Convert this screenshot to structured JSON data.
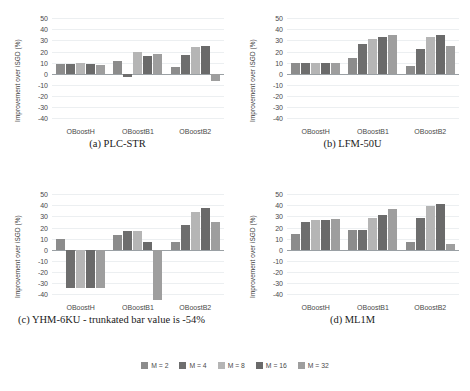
{
  "figure": {
    "ylabel": "Improvement over iSGD (%)",
    "yticks": [
      50,
      40,
      30,
      20,
      10,
      0,
      -10,
      -20,
      -30,
      -40
    ],
    "ylim": [
      -45,
      52
    ],
    "categories": [
      "OBoostH",
      "OBoostB1",
      "OBoostB2"
    ],
    "series_names": [
      "M = 2",
      "M = 4",
      "M = 8",
      "M = 16",
      "M = 32"
    ],
    "colors": [
      "#8c8c8c",
      "#6e6e6e",
      "#b5b5b5",
      "#6a6a6a",
      "#9e9e9e"
    ],
    "captions": {
      "a": "(a) PLC-STR",
      "b": "(b) LFM-50U",
      "c": "(c) YHM-6KU - trunkated bar value is -54%",
      "d": "(d) ML1M"
    }
  },
  "legend": {
    "items": [
      {
        "label": "M = 2",
        "color": "#8c8c8c"
      },
      {
        "label": "M = 4",
        "color": "#6e6e6e"
      },
      {
        "label": "M = 8",
        "color": "#b5b5b5"
      },
      {
        "label": "M = 16",
        "color": "#6a6a6a"
      },
      {
        "label": "M = 32",
        "color": "#9e9e9e"
      }
    ]
  },
  "chart_data": [
    {
      "id": "a",
      "type": "bar",
      "title": "(a) PLC-STR",
      "xlabel": "",
      "ylabel": "Improvement over iSGD (%)",
      "ylim": [
        -45,
        52
      ],
      "grid": true,
      "legend_position": "bottom",
      "categories": [
        "OBoostH",
        "OBoostB1",
        "OBoostB2"
      ],
      "series": [
        {
          "name": "M = 2",
          "values": [
            9,
            12,
            6
          ]
        },
        {
          "name": "M = 4",
          "values": [
            9,
            -3,
            17
          ]
        },
        {
          "name": "M = 8",
          "values": [
            10,
            20,
            24
          ]
        },
        {
          "name": "M = 16",
          "values": [
            9,
            16,
            25
          ]
        },
        {
          "name": "M = 32",
          "values": [
            8,
            18,
            -6
          ]
        }
      ]
    },
    {
      "id": "b",
      "type": "bar",
      "title": "(b) LFM-50U",
      "xlabel": "",
      "ylabel": "Improvement over iSGD (%)",
      "ylim": [
        -45,
        52
      ],
      "grid": true,
      "legend_position": "bottom",
      "categories": [
        "OBoostH",
        "OBoostB1",
        "OBoostB2"
      ],
      "series": [
        {
          "name": "M = 2",
          "values": [
            10,
            14,
            7
          ]
        },
        {
          "name": "M = 4",
          "values": [
            10,
            27,
            22
          ]
        },
        {
          "name": "M = 8",
          "values": [
            10,
            31,
            33
          ]
        },
        {
          "name": "M = 16",
          "values": [
            10,
            33,
            35
          ]
        },
        {
          "name": "M = 32",
          "values": [
            10,
            35,
            25
          ]
        }
      ]
    },
    {
      "id": "c",
      "type": "bar",
      "title": "(c) YHM-6KU - trunkated bar value is -54%",
      "xlabel": "",
      "ylabel": "Improvement over iSGD (%)",
      "ylim": [
        -45,
        52
      ],
      "grid": true,
      "legend_position": "bottom",
      "annotation": "trunkated bar value is -54%",
      "categories": [
        "OBoostH",
        "OBoostB1",
        "OBoostB2"
      ],
      "series": [
        {
          "name": "M = 2",
          "values": [
            10,
            13,
            7
          ]
        },
        {
          "name": "M = 4",
          "values": [
            -34,
            17,
            22
          ]
        },
        {
          "name": "M = 8",
          "values": [
            -34,
            17,
            34
          ]
        },
        {
          "name": "M = 16",
          "values": [
            -34,
            7,
            38
          ]
        },
        {
          "name": "M = 32",
          "values": [
            -34,
            -54,
            25
          ]
        }
      ]
    },
    {
      "id": "d",
      "type": "bar",
      "title": "(d) ML1M",
      "xlabel": "",
      "ylabel": "Improvement over iSGD (%)",
      "ylim": [
        -45,
        52
      ],
      "grid": true,
      "legend_position": "bottom",
      "categories": [
        "OBoostH",
        "OBoostB1",
        "OBoostB2"
      ],
      "series": [
        {
          "name": "M = 2",
          "values": [
            14,
            18,
            7
          ]
        },
        {
          "name": "M = 4",
          "values": [
            25,
            18,
            29
          ]
        },
        {
          "name": "M = 8",
          "values": [
            27,
            29,
            39
          ]
        },
        {
          "name": "M = 16",
          "values": [
            27,
            31,
            41
          ]
        },
        {
          "name": "M = 32",
          "values": [
            28,
            37,
            5
          ]
        }
      ]
    }
  ]
}
